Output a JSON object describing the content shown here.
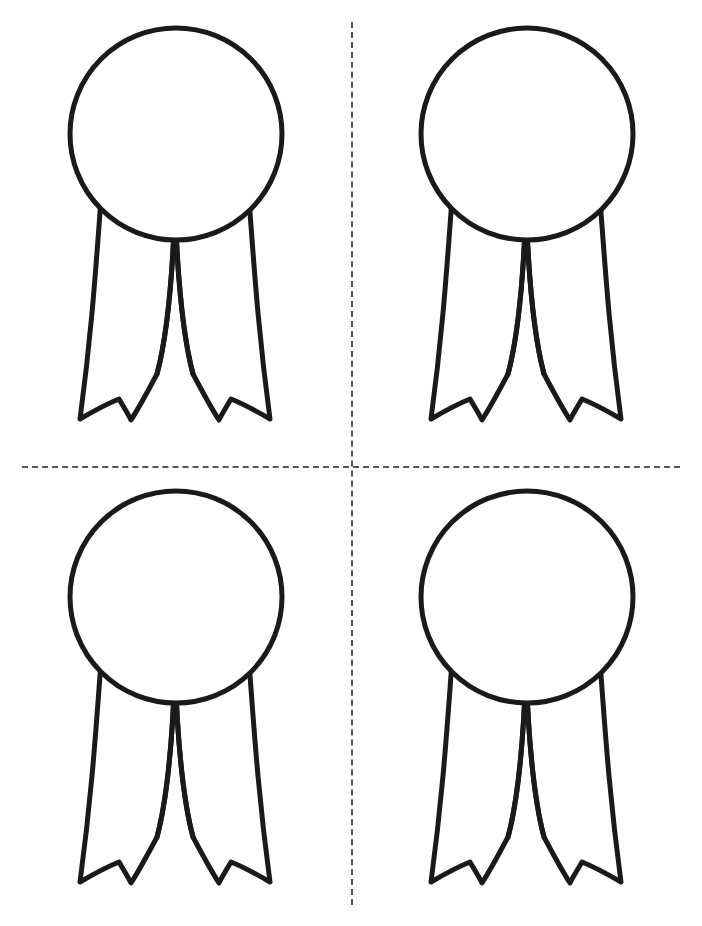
{
  "page": {
    "title": "Award Ribbon Cut-Out Template",
    "width": 702,
    "height": 926,
    "background_color": "#ffffff",
    "orientation": "portrait"
  },
  "style": {
    "outline_color": "#1a1a1a",
    "fill_color": "#ffffff",
    "outline_width": 5,
    "cut_line_color": "#555555",
    "cut_line_width": 2,
    "cut_line_style": "dashed"
  },
  "cut_lines": [
    {
      "id": "horizontal-cut-line",
      "name": "horizontal-cut-line",
      "orientation": "horizontal",
      "x": 22,
      "y": 466,
      "length": 658
    },
    {
      "id": "vertical-cut-line",
      "name": "vertical-cut-line",
      "orientation": "vertical",
      "x": 351,
      "y": 22,
      "length": 883
    }
  ],
  "grid": {
    "rows": 2,
    "columns": 2,
    "cell_width": 351,
    "cell_height": 463
  },
  "shape": {
    "type": "award-ribbon",
    "description": "Circular rosette medallion with two swallowtail ribbon streamers",
    "viewbox": "0 0 351 463",
    "circle": {
      "cx": 176,
      "cy": 134,
      "r": 106
    },
    "tails_path": "M 101 199 C 96 265, 92 330, 80 419 C 92 412, 104 405, 119 399 C 123 406, 127 412, 131 420 C 140 406, 148 391, 157 374 C 168 333, 173 266, 175 206 L 175 206 C 177 266, 182 333, 193 374 C 202 391, 210 406, 219 420 C 223 412, 227 406, 231 399 C 246 405, 258 412, 270 419 C 258 330, 254 265, 249 199 Z",
    "inner_left_line": "M 175 206 C 173 266, 168 333, 157 374",
    "inner_right_line": "M 175 206 C 177 266, 182 333, 193 374"
  },
  "ribbons": [
    {
      "id": "ribbon-top-left",
      "name": "ribbon-top-left",
      "position": "top-left",
      "x": 0,
      "y": 0
    },
    {
      "id": "ribbon-top-right",
      "name": "ribbon-top-right",
      "position": "top-right",
      "x": 351,
      "y": 0
    },
    {
      "id": "ribbon-bottom-left",
      "name": "ribbon-bottom-left",
      "position": "bottom-left",
      "x": 0,
      "y": 463
    },
    {
      "id": "ribbon-bottom-right",
      "name": "ribbon-bottom-right",
      "position": "bottom-right",
      "x": 351,
      "y": 463
    }
  ],
  "count": 4
}
